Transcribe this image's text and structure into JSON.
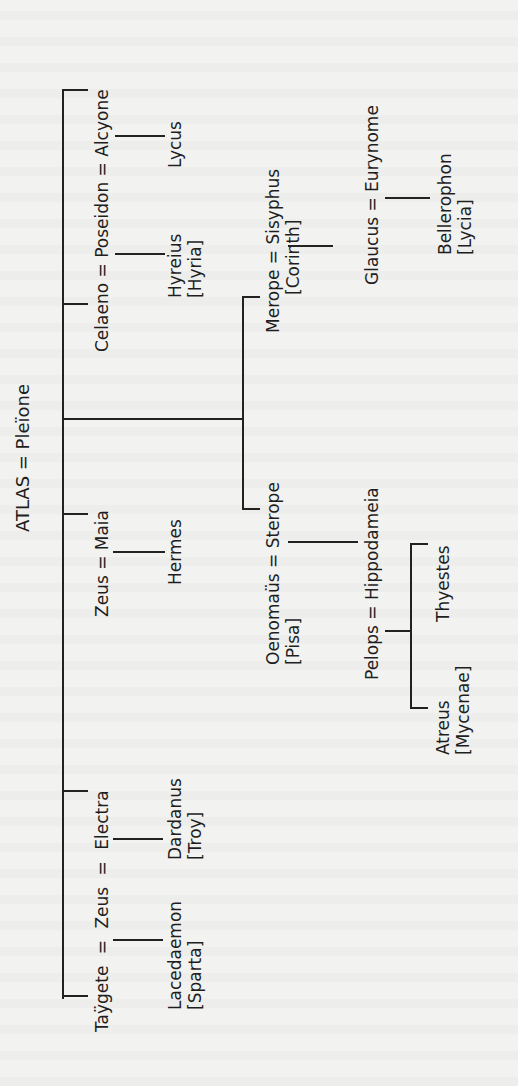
{
  "diagram": {
    "type": "genealogical-tree",
    "orientation": "rotated-90-ccw",
    "root": "ATLAS = Pleïone",
    "nodes": {
      "root": "ATLAS = Pleïone",
      "alcyone_line": "Celaeno = Poseidon = Alcyone",
      "hyreius": {
        "name": "Hyreius",
        "place": "[Hyria]"
      },
      "lycus": "Lycus",
      "maia_line": "Zeus = Maia",
      "hermes": "Hermes",
      "electra_line": "Taÿgete = Zeus = Electra",
      "lacedaemon": {
        "name": "Lacedaemon",
        "place": "[Sparta]"
      },
      "dardanus": {
        "name": "Dardanus",
        "place": "[Troy]"
      },
      "sterope_line": {
        "name": "Oenomaüs = Sterope",
        "place": "[Pisa]"
      },
      "merope_line": {
        "name": "Merope = Sisyphus",
        "place": "[Corinth]"
      },
      "glaucus_line": "Glaucus = Eurynome",
      "bellerophon": {
        "name": "Bellerophon",
        "place": "[Lycia]"
      },
      "pelops_line": "Pelops = Hippodameia",
      "atreus": {
        "name": "Atreus",
        "place": "[Mycenae]"
      },
      "thyestes": "Thyestes"
    },
    "colors": {
      "background": "#f2f2f1",
      "ink": "#1e1e1e"
    }
  }
}
